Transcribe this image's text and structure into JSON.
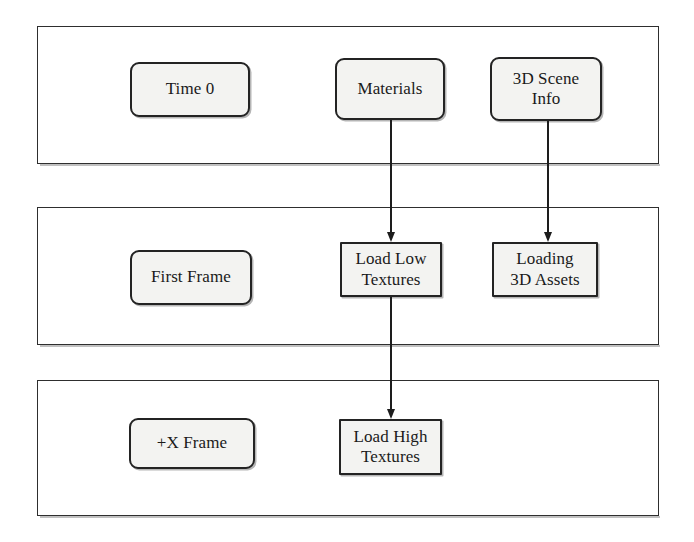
{
  "diagram": {
    "background_color": "#ffffff",
    "node_fill_color": "#f3f3f1",
    "node_border_color": "#232323",
    "lane_border_color": "#2e2e2e",
    "connector_color": "#1d1d1d",
    "lanes": [
      {
        "id": "lane-time-0",
        "name": "time-0-lane",
        "x": 37,
        "y": 26,
        "w": 622,
        "h": 138,
        "nodes": [
          {
            "id": "time-0",
            "label": "Time 0",
            "shape": "rounded",
            "x": 130,
            "y": 62,
            "w": 120,
            "h": 55
          },
          {
            "id": "materials",
            "label": "Materials",
            "shape": "rounded",
            "x": 335,
            "y": 58,
            "w": 110,
            "h": 62
          },
          {
            "id": "3d-scene-info",
            "label": "3D Scene\nInfo",
            "shape": "rounded",
            "x": 490,
            "y": 57,
            "w": 112,
            "h": 64
          }
        ]
      },
      {
        "id": "lane-first-frame",
        "name": "first-frame-lane",
        "x": 37,
        "y": 207,
        "w": 622,
        "h": 138,
        "nodes": [
          {
            "id": "first-frame",
            "label": "First Frame",
            "shape": "rounded",
            "x": 130,
            "y": 250,
            "w": 122,
            "h": 55
          },
          {
            "id": "load-low",
            "label": "Load Low\nTextures",
            "shape": "sharp",
            "x": 340,
            "y": 242,
            "w": 102,
            "h": 55
          },
          {
            "id": "loading-3d",
            "label": "Loading\n3D Assets",
            "shape": "sharp",
            "x": 492,
            "y": 242,
            "w": 106,
            "h": 55
          }
        ]
      },
      {
        "id": "lane-plus-x-frame",
        "name": "plus-x-frame-lane",
        "x": 37,
        "y": 380,
        "w": 622,
        "h": 136,
        "nodes": [
          {
            "id": "plus-x-frame",
            "label": "+X Frame",
            "shape": "rounded",
            "x": 129,
            "y": 418,
            "w": 126,
            "h": 51
          },
          {
            "id": "load-high",
            "label": "Load High\nTextures",
            "shape": "sharp",
            "x": 339,
            "y": 419,
            "w": 103,
            "h": 56
          }
        ]
      }
    ],
    "connectors": [
      {
        "id": "conn-materials-to-load-low",
        "name": "materials-to-load-low-textures",
        "from": "materials",
        "to": "load-low",
        "x": 390,
        "y_start": 120,
        "y_end": 242
      },
      {
        "id": "conn-scene-to-loading-3d",
        "name": "scene-info-to-loading-3d-assets",
        "from": "3d-scene-info",
        "to": "loading-3d",
        "x": 547,
        "y_start": 121,
        "y_end": 242
      },
      {
        "id": "conn-low-to-high",
        "name": "load-low-to-load-high-textures",
        "from": "load-low",
        "to": "load-high",
        "x": 390,
        "y_start": 297,
        "y_end": 419
      }
    ]
  }
}
